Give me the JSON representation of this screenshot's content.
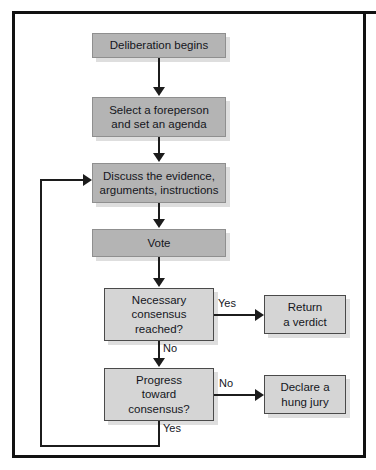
{
  "figure": {
    "colors": {
      "process_fill": "#b4b4b4",
      "decision_fill": "#d5d5d5",
      "terminal_fill": "#d5d5d5",
      "line": "#1c1c1c",
      "frame": "#111111",
      "background": "#ffffff",
      "text": "#14161c",
      "shadow": "#dedede"
    }
  },
  "nodes": [
    {
      "id": "start",
      "type": "process",
      "line1": "Deliberation begins",
      "line2": "",
      "line3": ""
    },
    {
      "id": "foreperson",
      "type": "process",
      "line1": "Select a foreperson",
      "line2": "and set an agenda",
      "line3": ""
    },
    {
      "id": "discuss",
      "type": "process",
      "line1": "Discuss the evidence,",
      "line2": "arguments, instructions",
      "line3": ""
    },
    {
      "id": "vote",
      "type": "process",
      "line1": "Vote",
      "line2": "",
      "line3": ""
    },
    {
      "id": "consensus",
      "type": "decision",
      "line1": "Necessary",
      "line2": "consensus",
      "line3": "reached?"
    },
    {
      "id": "verdict",
      "type": "terminal",
      "line1": "Return",
      "line2": "a verdict",
      "line3": ""
    },
    {
      "id": "progress",
      "type": "decision",
      "line1": "Progress",
      "line2": "toward",
      "line3": "consensus?"
    },
    {
      "id": "hungjury",
      "type": "terminal",
      "line1": "Declare a",
      "line2": "hung jury",
      "line3": ""
    }
  ],
  "edge_labels": {
    "consensus_yes": "Yes",
    "consensus_no": "No",
    "progress_no": "No",
    "progress_yes": "Yes"
  }
}
